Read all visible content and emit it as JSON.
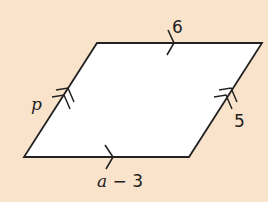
{
  "diagram": {
    "type": "parallelogram",
    "background_color": "#F9E3CB",
    "fill_color": "#FFFFFF",
    "stroke_color": "#222222",
    "vertices": {
      "top_left": [
        97,
        43
      ],
      "top_right": [
        262,
        43
      ],
      "bottom_right": [
        189,
        157
      ],
      "bottom_left": [
        24,
        157
      ]
    },
    "labels": {
      "top": "6",
      "bottom_var": "a",
      "bottom_rest": " − 3",
      "left": "p",
      "right": "5"
    },
    "markers": {
      "top_bottom": "single-arrow",
      "left_right": "double-arrow"
    }
  }
}
